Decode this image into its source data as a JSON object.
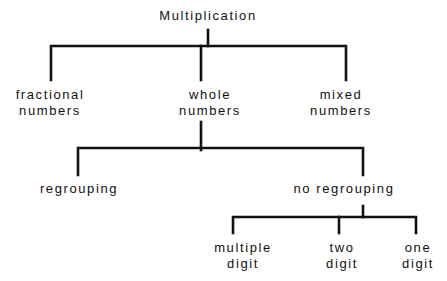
{
  "diagram": {
    "type": "tree",
    "root": {
      "label": "Multiplication"
    },
    "level1": [
      {
        "line1": "fractional",
        "line2": "numbers"
      },
      {
        "line1": "whole",
        "line2": "numbers"
      },
      {
        "line1": "mixed",
        "line2": "numbers"
      }
    ],
    "level2": [
      {
        "label": "regrouping"
      },
      {
        "label": "no regrouping"
      }
    ],
    "level3": [
      {
        "line1": "multiple",
        "line2": "digit"
      },
      {
        "line1": "two",
        "line2": "digit"
      },
      {
        "line1": "one",
        "line2": "digit"
      }
    ],
    "edges": [
      [
        "Multiplication",
        "fractional numbers"
      ],
      [
        "Multiplication",
        "whole numbers"
      ],
      [
        "Multiplication",
        "mixed numbers"
      ],
      [
        "whole numbers",
        "regrouping"
      ],
      [
        "whole numbers",
        "no regrouping"
      ],
      [
        "no regrouping",
        "multiple digit"
      ],
      [
        "no regrouping",
        "two digit"
      ],
      [
        "no regrouping",
        "one digit"
      ]
    ]
  }
}
